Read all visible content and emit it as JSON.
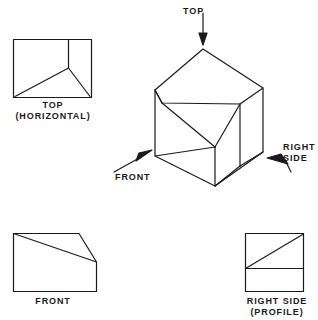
{
  "figure": {
    "type": "orthographic-projection-diagram",
    "background_color": "#ffffff",
    "line_color": "#1a1a1a"
  },
  "views": {
    "top": {
      "title": "TOP",
      "subtitle": "(HORIZONTAL)",
      "label": "TOP\n(HORIZONTAL)"
    },
    "front": {
      "title": "FRONT",
      "subtitle": "",
      "label": "FRONT"
    },
    "right_side": {
      "title": "RIGHT SIDE",
      "subtitle": "(PROFILE)",
      "label": "RIGHT SIDE\n(PROFILE)"
    }
  },
  "arrows": {
    "top": {
      "label": "TOP",
      "direction": "down"
    },
    "front": {
      "label": "FRONT",
      "direction": "up-right"
    },
    "right_side": {
      "label": "RIGHT\nSIDE",
      "direction": "up-left"
    }
  },
  "pictorial": {
    "name": "isometric-solid",
    "description": "isometric block with chamfered top-front corner"
  }
}
